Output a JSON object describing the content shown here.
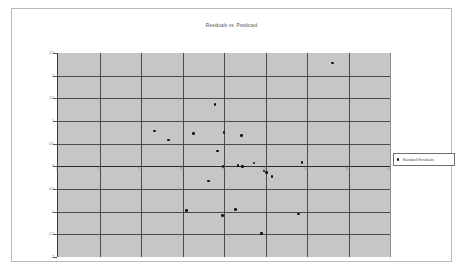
{
  "chart_data": {
    "type": "scatter",
    "title": "Residuals vs. Predicted",
    "xlabel": "",
    "ylabel": "",
    "xlim": [
      0,
      40
    ],
    "ylim": [
      -2,
      2.5
    ],
    "grid": true,
    "legend_position": "right",
    "series": [
      {
        "name": "Standard Residuals",
        "marker": "circle",
        "color": "#121212",
        "points": [
          {
            "x": 33.1,
            "y": 2.28
          },
          {
            "x": 18.9,
            "y": 1.37
          },
          {
            "x": 11.6,
            "y": 0.78
          },
          {
            "x": 16.3,
            "y": 0.72
          },
          {
            "x": 20.0,
            "y": 0.74
          },
          {
            "x": 22.1,
            "y": 0.68
          },
          {
            "x": 13.3,
            "y": 0.58
          },
          {
            "x": 19.2,
            "y": 0.34
          },
          {
            "x": 29.4,
            "y": 0.09
          },
          {
            "x": 23.6,
            "y": 0.07
          },
          {
            "x": 21.7,
            "y": 0.02
          },
          {
            "x": 19.9,
            "y": 0.0
          },
          {
            "x": 22.2,
            "y": -0.01
          },
          {
            "x": 24.8,
            "y": -0.1
          },
          {
            "x": 25.1,
            "y": -0.14
          },
          {
            "x": 25.8,
            "y": -0.22
          },
          {
            "x": 18.1,
            "y": -0.32
          },
          {
            "x": 15.5,
            "y": -0.98
          },
          {
            "x": 21.4,
            "y": -0.95
          },
          {
            "x": 19.8,
            "y": -1.09
          },
          {
            "x": 29.0,
            "y": -1.05
          },
          {
            "x": 24.5,
            "y": -1.48
          }
        ]
      }
    ],
    "y_ticks": [
      {
        "value": 2.5,
        "label": "2.5"
      },
      {
        "value": 2,
        "label": "2"
      },
      {
        "value": 1.5,
        "label": "1.5"
      },
      {
        "value": 1,
        "label": "1"
      },
      {
        "value": 0.5,
        "label": "0.5"
      },
      {
        "value": 0,
        "label": "0"
      },
      {
        "value": -0.5,
        "label": "-0.5"
      },
      {
        "value": -1,
        "label": "-1"
      },
      {
        "value": -1.5,
        "label": "-1.5"
      },
      {
        "value": -2,
        "label": "-2"
      }
    ],
    "x_ticks": [
      {
        "value": 0,
        "label": "0"
      },
      {
        "value": 5,
        "label": "5"
      },
      {
        "value": 10,
        "label": "10"
      },
      {
        "value": 15,
        "label": "15"
      },
      {
        "value": 20,
        "label": "20"
      },
      {
        "value": 25,
        "label": "25"
      },
      {
        "value": 30,
        "label": "30"
      },
      {
        "value": 35,
        "label": "35"
      },
      {
        "value": 40,
        "label": "40"
      }
    ]
  },
  "legend": {
    "series_label": "Standard Residuals"
  },
  "colors": {
    "plot_background": "#c6c6c6",
    "gridline": "#4b4b4b",
    "marker": "#121212",
    "frame_border": "#b9b9b9",
    "title_text": "#4a4a58"
  }
}
